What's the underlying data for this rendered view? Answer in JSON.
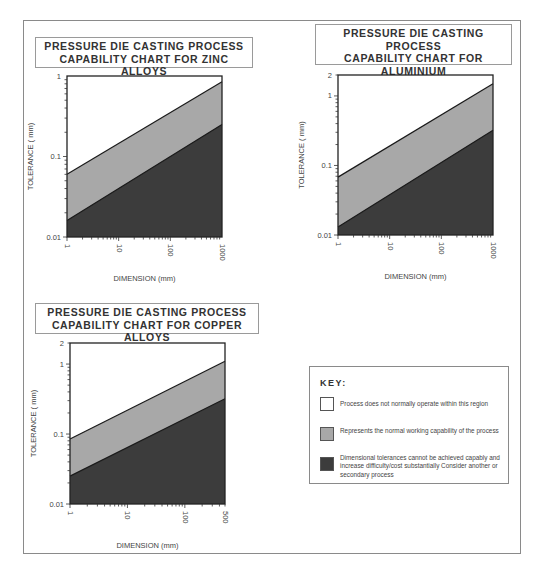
{
  "colors": {
    "capable_region": "#a8a8a8",
    "not_achievable_region": "#3c3c3c",
    "no_operation_region": "#ffffff",
    "lines": "#1a1a1a"
  },
  "key": {
    "title": "KEY:",
    "items": [
      {
        "swatch": "white",
        "text": "Process does not normally operate within this region"
      },
      {
        "swatch": "light-grey",
        "text": "Represents the normal working capability of the process"
      },
      {
        "swatch": "dark-grey",
        "text": "Dimensional tolerances cannot be achieved capably and increase difficulty/cost substantially Consider another or secondary process"
      }
    ]
  },
  "chart_data": [
    {
      "type": "area",
      "title": "PRESSURE DIE CASTING PROCESS CAPABILITY CHART FOR ZINC ALLOYS",
      "title_lines": [
        "PRESSURE DIE CASTING PROCESS",
        "CAPABILITY CHART FOR ZINC ALLOYS"
      ],
      "xlabel": "DIMENSION (mm)",
      "ylabel": "TOLERANCE ( mm)",
      "xscale": "log",
      "yscale": "log",
      "xlim": [
        1,
        1000
      ],
      "ylim": [
        0.01,
        1
      ],
      "xticks": [
        "1",
        "10",
        "100",
        "1000"
      ],
      "yticks": [
        "0.01",
        "0.1",
        "1"
      ],
      "x": [
        1,
        1000
      ],
      "series": [
        {
          "name": "Upper boundary (normal capability upper limit)",
          "values": [
            0.06,
            0.85
          ]
        },
        {
          "name": "Lower boundary (achievable limit)",
          "values": [
            0.016,
            0.25
          ]
        }
      ],
      "grid": false
    },
    {
      "type": "area",
      "title": "PRESSURE DIE CASTING PROCESS CAPABILITY CHART FOR ALUMINIUM AND MAGNESIUM ALLOYS",
      "title_lines": [
        "PRESSURE DIE CASTING PROCESS",
        "CAPABILITY CHART FOR ALUMINIUM",
        "AND MAGNESIUM ALLOYS"
      ],
      "xlabel": "DIMENSION (mm)",
      "ylabel": "TOLERANCE ( mm)",
      "xscale": "log",
      "yscale": "log",
      "xlim": [
        1,
        1000
      ],
      "ylim": [
        0.01,
        2
      ],
      "xticks": [
        "1",
        "10",
        "100",
        "1000"
      ],
      "yticks": [
        "0.01",
        "0.1",
        "1",
        "2"
      ],
      "x": [
        1,
        1000
      ],
      "series": [
        {
          "name": "Upper boundary (normal capability upper limit)",
          "values": [
            0.068,
            1.5
          ]
        },
        {
          "name": "Lower boundary (achievable limit)",
          "values": [
            0.013,
            0.32
          ]
        }
      ],
      "grid": false
    },
    {
      "type": "area",
      "title": "PRESSURE DIE CASTING PROCESS CAPABILITY CHART FOR COPPER ALLOYS",
      "title_lines": [
        "PRESSURE DIE CASTING PROCESS",
        "CAPABILITY CHART FOR COPPER ALLOYS"
      ],
      "xlabel": "DIMENSION (mm)",
      "ylabel": "TOLERANCE ( mm)",
      "xscale": "log",
      "yscale": "log",
      "xlim": [
        1,
        500
      ],
      "ylim": [
        0.01,
        2
      ],
      "xticks": [
        "1",
        "10",
        "100",
        "500"
      ],
      "yticks": [
        "0.01",
        "0.1",
        "1",
        "2"
      ],
      "x": [
        1,
        500
      ],
      "series": [
        {
          "name": "Upper boundary (normal capability upper limit)",
          "values": [
            0.085,
            1.1
          ]
        },
        {
          "name": "Lower boundary (achievable limit)",
          "values": [
            0.025,
            0.32
          ]
        }
      ],
      "grid": false
    }
  ]
}
